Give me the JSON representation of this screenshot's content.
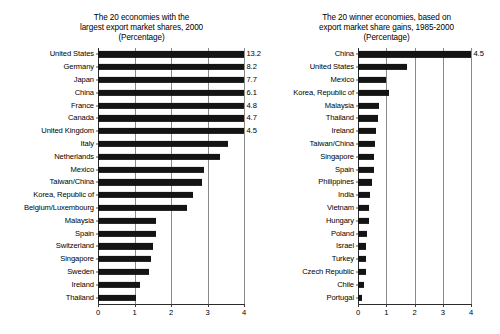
{
  "chart_data": [
    {
      "type": "bar",
      "orientation": "horizontal",
      "title": "The 20 economies with the\nlargest export market shares, 2000\n(Percentage)",
      "xlabel": "",
      "ylabel": "",
      "xlim": [
        0,
        4
      ],
      "xticks": [
        "0",
        "1",
        "2",
        "3",
        "4"
      ],
      "grid": true,
      "legend": "none",
      "note": "Bars for the top seven economies extend beyond the axis maximum of 4 and are annotated with their exact values.",
      "categories": [
        "United States",
        "Germany",
        "Japan",
        "China",
        "France",
        "Canada",
        "United Kingdom",
        "Italy",
        "Netherlands",
        "Mexico",
        "Taiwan/China",
        "Korea, Republic of",
        "Belgium/Luxembourg",
        "Malaysia",
        "Spain",
        "Switzerland",
        "Singapore",
        "Sweden",
        "Ireland",
        "Thailand"
      ],
      "values": [
        13.2,
        8.2,
        7.7,
        6.1,
        4.8,
        4.7,
        4.5,
        3.55,
        3.35,
        2.9,
        2.85,
        2.6,
        2.45,
        1.6,
        1.6,
        1.5,
        1.45,
        1.4,
        1.15,
        1.05
      ],
      "value_labels": [
        "13.2",
        "8.2",
        "7.7",
        "6.1",
        "4.8",
        "4.7",
        "4.5",
        "",
        "",
        "",
        "",
        "",
        "",
        "",
        "",
        "",
        "",
        "",
        "",
        ""
      ]
    },
    {
      "type": "bar",
      "orientation": "horizontal",
      "title": "The 20 winner economies, based on\nexport market share gains, 1985-2000\n(Percentage)",
      "xlabel": "",
      "ylabel": "",
      "xlim": [
        0,
        4
      ],
      "xticks": [
        "0",
        "1",
        "2",
        "3",
        "4"
      ],
      "grid": true,
      "legend": "none",
      "note": "China's bar extends beyond the axis maximum of 4 and is annotated with its exact value.",
      "categories": [
        "China",
        "United States",
        "Mexico",
        "Korea, Republic of",
        "Malaysia",
        "Thailand",
        "Ireland",
        "Taiwan/China",
        "Singapore",
        "Spain",
        "Philippines",
        "India",
        "Vietnam",
        "Hungary",
        "Poland",
        "Israel",
        "Turkey",
        "Czech Republic",
        "Chile",
        "Portugal"
      ],
      "values": [
        4.5,
        1.75,
        1.0,
        1.1,
        0.75,
        0.7,
        0.65,
        0.6,
        0.55,
        0.55,
        0.5,
        0.42,
        0.4,
        0.4,
        0.33,
        0.3,
        0.3,
        0.28,
        0.22,
        0.15
      ],
      "value_labels": [
        "4.5",
        "",
        "",
        "",
        "",
        "",
        "",
        "",
        "",
        "",
        "",
        "",
        "",
        "",
        "",
        "",
        "",
        "",
        "",
        ""
      ]
    }
  ],
  "colors": {
    "bar": "#141414",
    "grid": "#8a8a8a",
    "axis": "#2b2b2b",
    "background": "#ffffff",
    "text": "#000000"
  }
}
